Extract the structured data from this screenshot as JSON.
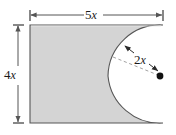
{
  "figure": {
    "name": "shaded-region-rectangle-minus-semicircle",
    "type": "geometry-diagram",
    "background_color": "#ffffff",
    "shaded_fill_color": "#d4d4d4",
    "outline_color": "#4d4d4d",
    "dimension_line_color": "#555555",
    "dashed_line_color": "#9a9a9a",
    "center_dot_color": "#111111",
    "labels": {
      "width": {
        "coefficient": "5",
        "variable": "x",
        "text": "5x"
      },
      "height": {
        "coefficient": "4",
        "variable": "x",
        "text": "4x"
      },
      "radius": {
        "coefficient": "2",
        "variable": "x",
        "text": "2x"
      }
    },
    "geometry": {
      "rectangle": {
        "left": 30,
        "top": 25,
        "right": 163,
        "bottom": 123,
        "width_units": "5x",
        "height_units": "4x"
      },
      "semicircle_cut": {
        "center_x": 160,
        "center_y": 76,
        "radius_px": 52,
        "radius_units": "2x",
        "side": "right"
      },
      "width_dimension_arrow": {
        "y": 15,
        "x_start": 30,
        "x_end": 163,
        "double_headed": true
      },
      "height_dimension_arrow": {
        "x": 18,
        "y_start": 25,
        "y_end": 123,
        "double_headed": true
      },
      "radius_dimension_arrow": {
        "x_start": 124,
        "y_start": 45,
        "x_end": 157,
        "y_end": 72,
        "double_headed": true
      },
      "radius_dashed_line": {
        "x_start": 114,
        "y_start": 58,
        "x_end": 158,
        "y_end": 75
      }
    }
  }
}
